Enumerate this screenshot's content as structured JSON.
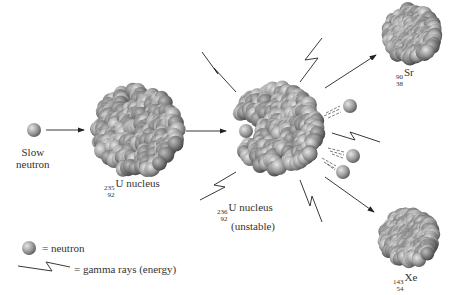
{
  "labels": {
    "slow_neutron": [
      "Slow",
      "neutron"
    ],
    "u235": {
      "mass": "235",
      "atomic": "92",
      "symbol": "U",
      "suffix": " nucleus"
    },
    "u236": {
      "mass": "236",
      "atomic": "92",
      "symbol": "U",
      "suffix": " nucleus",
      "note": "(unstable)"
    },
    "sr90": {
      "mass": "90",
      "atomic": "38",
      "symbol": "Sr"
    },
    "xe143": {
      "mass": "143",
      "atomic": "54",
      "symbol": "Xe"
    }
  },
  "legend": {
    "neutron": "= neutron",
    "gamma": "= gamma rays (energy)"
  },
  "colors": {
    "sphere_light": "#d4d4d4",
    "sphere_dark": "#6e6e6e",
    "line": "#222222"
  }
}
